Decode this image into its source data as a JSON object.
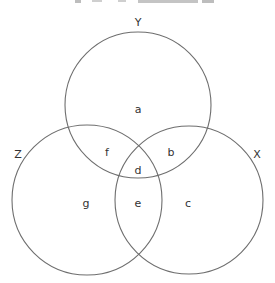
{
  "diagram": {
    "type": "venn-3",
    "stroke_color": "#6e6e6e",
    "text_color": "#333333",
    "sets": [
      {
        "name": "Y",
        "cx": 138,
        "cy": 105,
        "r": 73,
        "label_x": 138,
        "label_y": 26
      },
      {
        "name": "Z",
        "cx": 87,
        "cy": 200,
        "r": 75,
        "label_x": 18,
        "label_y": 158
      },
      {
        "name": "X",
        "cx": 189,
        "cy": 200,
        "r": 74,
        "label_x": 257,
        "label_y": 158
      }
    ],
    "regions": [
      {
        "label": "a",
        "x": 138,
        "y": 110
      },
      {
        "label": "f",
        "x": 107,
        "y": 153
      },
      {
        "label": "b",
        "x": 171,
        "y": 153
      },
      {
        "label": "d",
        "x": 138,
        "y": 171
      },
      {
        "label": "g",
        "x": 86,
        "y": 204
      },
      {
        "label": "e",
        "x": 138,
        "y": 204
      },
      {
        "label": "c",
        "x": 188,
        "y": 204
      }
    ]
  }
}
